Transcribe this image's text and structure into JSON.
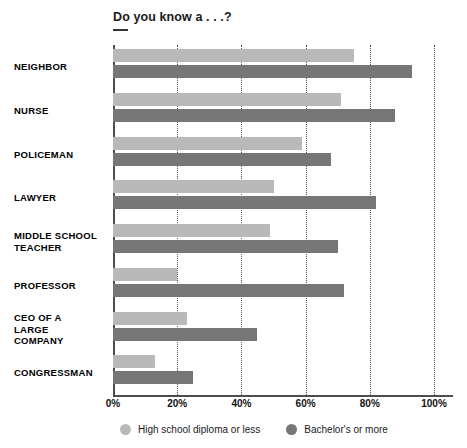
{
  "chart_data": {
    "type": "bar",
    "orientation": "horizontal",
    "title": "Do you know a . . .?",
    "xlabel": "",
    "ylabel": "",
    "xlim": [
      0,
      100
    ],
    "xticks": [
      "0%",
      "20%",
      "40%",
      "60%",
      "80%",
      "100%"
    ],
    "xtick_values": [
      0,
      20,
      40,
      60,
      80,
      100
    ],
    "grid": "vertical-dotted",
    "legend_position": "bottom",
    "categories": [
      "NEIGHBOR",
      "NURSE",
      "POLICEMAN",
      "LAWYER",
      "MIDDLE SCHOOL\nTEACHER",
      "PROFESSOR",
      "CEO OF A\nLARGE\nCOMPANY",
      "CONGRESSMAN"
    ],
    "series": [
      {
        "name": "High school diploma or less",
        "color": "#b9b9b9",
        "values": [
          75,
          71,
          59,
          50,
          49,
          20,
          23,
          13
        ]
      },
      {
        "name": "Bachelor's or more",
        "color": "#767676",
        "values": [
          93,
          88,
          68,
          82,
          70,
          72,
          45,
          25
        ]
      }
    ]
  },
  "colors": {
    "light_gray": "#b9b9b9",
    "dark_gray": "#767676",
    "axis": "#4d4d4d",
    "gridline": "#555555",
    "background": "#ffffff",
    "text": "#000000"
  }
}
